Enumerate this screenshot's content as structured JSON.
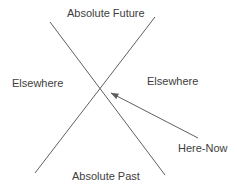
{
  "diagram": {
    "type": "light-cone-diagram",
    "background_color": "#ffffff",
    "line_color": "#5f5f5f",
    "text_color": "#3d3d3d",
    "labels": {
      "absolute_future": "Absolute Future",
      "elsewhere_left": "Elsewhere",
      "elsewhere_right": "Elsewhere",
      "absolute_past": "Absolute Past",
      "here_now": "Here-Now"
    },
    "lines": [
      {
        "x1": 50,
        "y1": 22,
        "x2": 165,
        "y2": 175
      },
      {
        "x1": 155,
        "y1": 17,
        "x2": 35,
        "y2": 173
      }
    ],
    "arrow": {
      "x1": 198,
      "y1": 138,
      "x2": 111,
      "y2": 93
    },
    "crossing_point": {
      "x": 101,
      "y": 88
    }
  }
}
